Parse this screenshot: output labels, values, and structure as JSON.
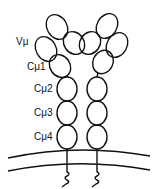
{
  "diagram": {
    "labels": {
      "v": "Vμ",
      "c1": "Cμ1",
      "c2": "Cμ2",
      "c3": "Cμ3",
      "c4": "Cμ4"
    },
    "colors": {
      "stroke": "#111111",
      "background": "#ffffff"
    }
  }
}
